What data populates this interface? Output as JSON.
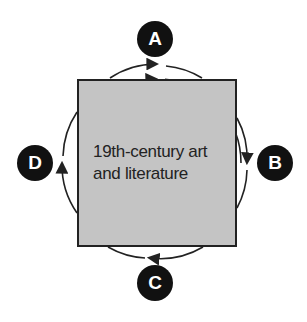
{
  "diagram": {
    "center": {
      "line1": "19th-century art",
      "line2": "and literature",
      "fill": "#c4c4c4"
    },
    "nodes": [
      {
        "id": "A",
        "label": "A",
        "position": "top"
      },
      {
        "id": "B",
        "label": "B",
        "position": "right"
      },
      {
        "id": "C",
        "label": "C",
        "position": "bottom"
      },
      {
        "id": "D",
        "label": "D",
        "position": "left"
      }
    ],
    "cycle_direction": "clockwise",
    "node_color": "#111111"
  }
}
